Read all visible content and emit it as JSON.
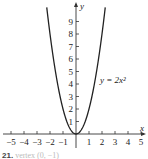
{
  "chart_data": {
    "type": "line",
    "title": "",
    "xlabel": "x",
    "ylabel": "y",
    "xlim": [
      -5.5,
      5.5
    ],
    "ylim": [
      0,
      10
    ],
    "x_ticks": [
      -5,
      -4,
      -3,
      -2,
      -1,
      1,
      2,
      3,
      4,
      5
    ],
    "y_ticks": [
      1,
      2,
      3,
      4,
      5,
      6,
      7,
      8,
      9
    ],
    "grid": false,
    "series": [
      {
        "name": "y = 2x²",
        "equation": "y = 2x^2",
        "x": [
          -2.2,
          -2,
          -1.5,
          -1,
          -0.5,
          0,
          0.5,
          1,
          1.5,
          2,
          2.2
        ],
        "y": [
          9.68,
          8,
          4.5,
          2,
          0.5,
          0,
          0.5,
          2,
          4.5,
          8,
          9.68
        ]
      }
    ],
    "annotations": [
      {
        "text": "y = 2x²",
        "x": 2.3,
        "y": 4.4
      }
    ]
  },
  "labels": {
    "x_axis": "x",
    "y_axis": "y",
    "curve": "y = 2x²",
    "x_tick_labels": [
      "−5",
      "−4",
      "−3",
      "−2",
      "−1",
      "1",
      "2",
      "3",
      "4",
      "5"
    ],
    "y_tick_labels": [
      "1",
      "2",
      "3",
      "4",
      "5",
      "6",
      "7",
      "8",
      "9"
    ]
  },
  "caption": {
    "number": "21.",
    "text": "vertex (0, −1)"
  },
  "colors": {
    "axis": "#333333",
    "curve": "#222222",
    "text": "#222222"
  }
}
